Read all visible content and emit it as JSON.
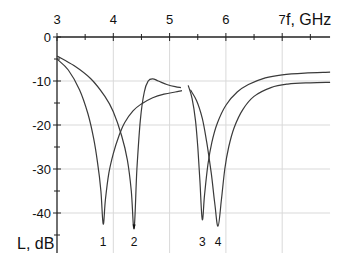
{
  "chart_data": {
    "type": "line",
    "title": "",
    "xlabel": "f, GHz",
    "ylabel": "L, dB",
    "xlim": [
      3,
      7.85
    ],
    "ylim": [
      -49,
      0
    ],
    "x_axis_position": "top",
    "grid": true,
    "x_ticks": [
      3,
      4,
      5,
      6,
      7
    ],
    "x_tick_labels": [
      "3",
      "4",
      "5",
      "6",
      "7"
    ],
    "y_ticks": [
      0,
      -10,
      -20,
      -30,
      -40
    ],
    "y_tick_labels": [
      "0",
      "-10",
      "-20",
      "-30",
      "-40"
    ],
    "series": [
      {
        "name": "curve A (resonances 1, 3)",
        "segments": [
          {
            "x": [
              3.0,
              3.2,
              3.4,
              3.55,
              3.65,
              3.72,
              3.78,
              3.82,
              3.86,
              3.92,
              4.0,
              4.1,
              4.2,
              4.35,
              4.5,
              4.7,
              4.9,
              5.1,
              5.22
            ],
            "y": [
              -5.0,
              -7.5,
              -12.0,
              -17.5,
              -23.0,
              -28.5,
              -35.0,
              -42.5,
              -37.0,
              -31.0,
              -26.5,
              -22.5,
              -19.5,
              -16.8,
              -15.2,
              -13.8,
              -13.0,
              -12.5,
              -12.2
            ]
          },
          {
            "x": [
              5.33,
              5.4,
              5.46,
              5.5,
              5.54,
              5.58,
              5.62,
              5.68,
              5.75,
              5.85,
              6.0,
              6.2,
              6.4,
              6.7,
              7.0,
              7.4,
              7.85
            ],
            "y": [
              -11.0,
              -14.0,
              -19.0,
              -25.0,
              -33.0,
              -41.5,
              -36.0,
              -29.0,
              -24.0,
              -19.5,
              -15.5,
              -12.5,
              -10.8,
              -9.3,
              -8.6,
              -8.2,
              -8.0
            ]
          }
        ]
      },
      {
        "name": "curve B (resonances 2, 4)",
        "segments": [
          {
            "x": [
              3.0,
              3.3,
              3.6,
              3.85,
              4.0,
              4.15,
              4.25,
              4.32,
              4.37,
              4.42,
              4.48,
              4.55,
              4.62,
              4.7,
              4.8,
              4.95,
              5.1,
              5.2
            ],
            "y": [
              -4.3,
              -6.5,
              -9.5,
              -13.5,
              -17.0,
              -22.5,
              -28.0,
              -35.0,
              -43.5,
              -30.0,
              -19.0,
              -12.5,
              -10.0,
              -9.5,
              -10.0,
              -10.8,
              -11.3,
              -11.5
            ]
          },
          {
            "x": [
              5.37,
              5.48,
              5.58,
              5.66,
              5.74,
              5.8,
              5.86,
              5.92,
              5.98,
              6.05,
              6.15,
              6.3,
              6.5,
              6.8,
              7.1,
              7.5,
              7.85
            ],
            "y": [
              -12.0,
              -14.5,
              -18.5,
              -24.0,
              -31.0,
              -37.5,
              -43.0,
              -37.0,
              -30.0,
              -25.0,
              -20.5,
              -16.5,
              -13.5,
              -11.5,
              -10.7,
              -10.4,
              -10.3
            ]
          }
        ]
      }
    ],
    "annotations": [
      {
        "text": "1",
        "x": 3.82,
        "y": -42.5
      },
      {
        "text": "2",
        "x": 4.37,
        "y": -43.5
      },
      {
        "text": "3",
        "x": 5.58,
        "y": -41.5
      },
      {
        "text": "4",
        "x": 5.86,
        "y": -43.0
      }
    ],
    "legend": null
  },
  "labels": {
    "x_axis_title": "f, GHz",
    "y_axis_title": "L, dB",
    "x_ticks": [
      "3",
      "4",
      "5",
      "6",
      "7"
    ],
    "y_ticks": [
      "0",
      "-10",
      "-20",
      "-30",
      "-40"
    ],
    "markers": [
      "1",
      "2",
      "3",
      "4"
    ]
  },
  "colors": {
    "curve": "#3a3a3a",
    "axis": "#222222",
    "grid": "#d9d9d9"
  }
}
